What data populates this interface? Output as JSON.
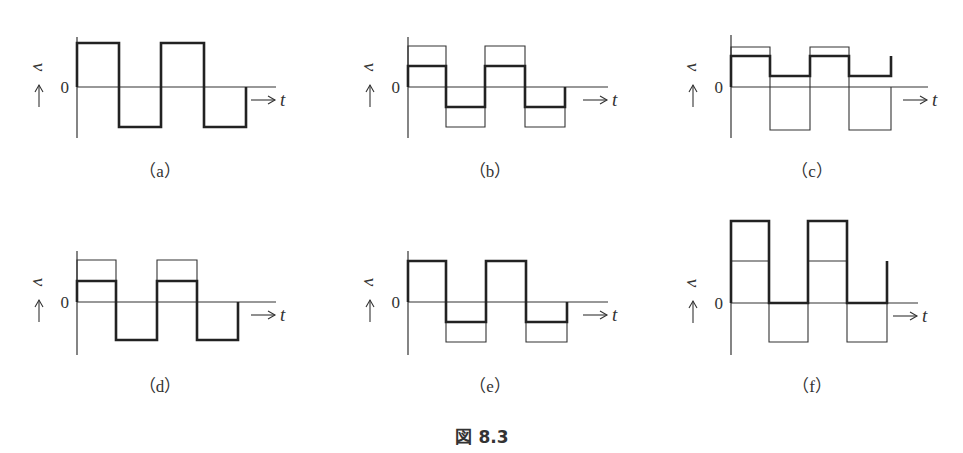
{
  "figure": {
    "caption": "図 8.3",
    "axis_labels": {
      "v": "v",
      "t": "t",
      "zero": "0",
      "arrow_up": "↑",
      "arrow_right": "→"
    }
  },
  "panels": [
    {
      "id": "a",
      "label": "（a）",
      "ox": 77,
      "zy": 87,
      "axis_top": 37,
      "axis_bottom": 138,
      "axis_right": 276,
      "xs": [
        77,
        119,
        161,
        204,
        246
      ],
      "thin": null,
      "thick": {
        "hi": 43,
        "lo": 127
      }
    },
    {
      "id": "b",
      "label": "（b）",
      "ox": 408,
      "zy": 87,
      "axis_top": 37,
      "axis_bottom": 138,
      "axis_right": 608,
      "xs": [
        408,
        446,
        485,
        525,
        565
      ],
      "thin": {
        "hi": 46,
        "lo": 127
      },
      "thick": {
        "hi": 66,
        "lo": 107
      }
    },
    {
      "id": "c",
      "label": "（c）",
      "ox": 731,
      "zy": 87,
      "axis_top": 35,
      "axis_bottom": 138,
      "axis_right": 928,
      "xs": [
        731,
        770,
        810,
        849,
        891
      ],
      "thin": {
        "hi": 47,
        "lo": 130
      },
      "thick": {
        "hi": 56,
        "lo": 76,
        "end_spike": 56
      }
    },
    {
      "id": "d",
      "label": "（d）",
      "ox": 77,
      "zy": 302,
      "axis_top": 251,
      "axis_bottom": 355,
      "axis_right": 276,
      "xs": [
        77,
        116,
        157,
        197,
        238
      ],
      "thin": {
        "hi": 260,
        "lo": null
      },
      "thick": {
        "hi": 281,
        "lo": 340
      }
    },
    {
      "id": "e",
      "label": "（e）",
      "ox": 408,
      "zy": 302,
      "axis_top": 251,
      "axis_bottom": 355,
      "axis_right": 608,
      "xs": [
        408,
        446,
        486,
        526,
        567
      ],
      "thin": {
        "hi": null,
        "lo": 342
      },
      "thick": {
        "hi": 261,
        "lo": 322
      }
    },
    {
      "id": "f",
      "label": "（f）",
      "ox": 731,
      "zy": 303,
      "axis_top": 221,
      "axis_bottom": 355,
      "axis_right": 918,
      "xs": [
        731,
        769,
        808,
        847,
        887
      ],
      "thin": {
        "hi": 261,
        "lo": 342
      },
      "thick": {
        "hi": 221,
        "lo": 303,
        "end_spike": 261
      }
    }
  ]
}
